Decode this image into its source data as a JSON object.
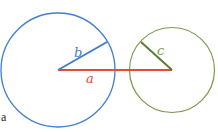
{
  "panel": {
    "label": "a"
  },
  "colors": {
    "blue": "#3f7fd0",
    "green": "#7a9a4a",
    "red": "#e8493a",
    "dark_green": "#5a7d32",
    "label_gray": "#222222"
  },
  "circles": [
    {
      "name": "large-blue-circle",
      "cx": 58,
      "cy": 70,
      "r": 57,
      "color": "#3f7fd0"
    },
    {
      "name": "small-green-circle",
      "cx": 172,
      "cy": 70,
      "r": 42.5,
      "color": "#7a9a4a"
    }
  ],
  "segments": {
    "a": {
      "label": "a",
      "x1": 58,
      "y1": 70,
      "x2": 172,
      "y2": 70,
      "color": "#e8493a",
      "label_x": 89,
      "label_y": 83
    },
    "b": {
      "label": "b",
      "x1": 58,
      "y1": 70,
      "x2": 107,
      "y2": 42,
      "color": "#3f7fd0",
      "label_x": 75,
      "label_y": 56
    },
    "c": {
      "label": "c",
      "x1": 172,
      "y1": 70,
      "x2": 141,
      "y2": 42,
      "color": "#5a7d32",
      "label_x": 157,
      "label_y": 55
    }
  }
}
